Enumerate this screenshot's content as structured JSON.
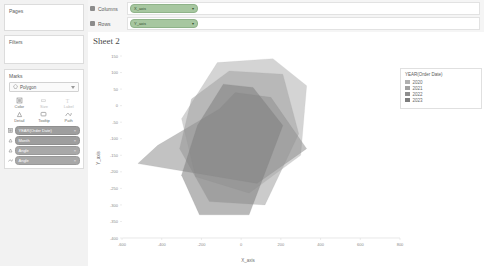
{
  "left_panel": {
    "pages": {
      "title": "Pages"
    },
    "filters": {
      "title": "Filters"
    },
    "marks": {
      "title": "Marks",
      "mark_type": "Polygon",
      "mark_type_icon": "polygon-icon",
      "properties": [
        {
          "label": "Color",
          "icon": "color-icon",
          "enabled": true
        },
        {
          "label": "Size",
          "icon": "size-icon",
          "enabled": false
        },
        {
          "label": "Label",
          "icon": "label-icon",
          "enabled": false
        },
        {
          "label": "Detail",
          "icon": "detail-icon",
          "enabled": true
        },
        {
          "label": "Tooltip",
          "icon": "tooltip-icon",
          "enabled": true
        },
        {
          "label": "Path",
          "icon": "path-icon",
          "enabled": true
        }
      ],
      "pills": [
        {
          "icon": "color-legend-icon",
          "label": "YEAR(Order Date)",
          "shade": "dark"
        },
        {
          "icon": "detail-icon",
          "label": "Month",
          "shade": "dark"
        },
        {
          "icon": "detail-icon",
          "label": "Angle",
          "shade": "light"
        },
        {
          "icon": "path-icon",
          "label": "Angle",
          "shade": "light"
        }
      ]
    }
  },
  "shelves": {
    "columns": {
      "name": "Columns",
      "pill": "X_axis",
      "icon": "columns-icon"
    },
    "rows": {
      "name": "Rows",
      "pill": "Y_axis",
      "icon": "rows-icon"
    }
  },
  "sheet": {
    "title": "Sheet 2"
  },
  "legend": {
    "title": "YEAR(Order Date)",
    "items": [
      {
        "label": "2020",
        "color": "#b0b0b0"
      },
      {
        "label": "2021",
        "color": "#a0a0a0"
      },
      {
        "label": "2022",
        "color": "#8f8f8f"
      },
      {
        "label": "2023",
        "color": "#7d7d7d"
      }
    ]
  },
  "chart_data": {
    "type": "area",
    "title": "Sheet 2",
    "xlabel": "X_axis",
    "ylabel": "Y_axis",
    "grid": false,
    "legend_position": "right",
    "xlim": [
      -600,
      800
    ],
    "ylim": [
      -400,
      150
    ],
    "xticks": [
      -600,
      -400,
      -200,
      0,
      200,
      400,
      600,
      800
    ],
    "yticks": [
      150,
      100,
      50,
      0,
      -50,
      -100,
      -150,
      -200,
      -250,
      -300,
      -350,
      -400
    ],
    "xticklabels": [
      "-600",
      "-400",
      "-200",
      "0",
      "200",
      "400",
      "600",
      "800"
    ],
    "yticklabels": [
      "150",
      "100",
      "50",
      "0",
      "-50",
      "-100",
      "-150",
      "-200",
      "-250",
      "-300",
      "-350",
      "-400"
    ],
    "series": [
      {
        "name": "2020",
        "color": "#b0b0b0",
        "opacity": 0.55,
        "points": [
          [
            -120,
            130
          ],
          [
            160,
            142
          ],
          [
            330,
            60
          ],
          [
            300,
            -150
          ],
          [
            40,
            -265
          ],
          [
            -230,
            -215
          ],
          [
            -300,
            -40
          ]
        ]
      },
      {
        "name": "2021",
        "color": "#a0a0a0",
        "opacity": 0.55,
        "points": [
          [
            -60,
            105
          ],
          [
            210,
            95
          ],
          [
            290,
            -85
          ],
          [
            120,
            -300
          ],
          [
            -160,
            -290
          ],
          [
            -310,
            -130
          ],
          [
            -250,
            20
          ]
        ]
      },
      {
        "name": "2022",
        "color": "#8f8f8f",
        "opacity": 0.55,
        "points": [
          [
            -30,
            40
          ],
          [
            150,
            25
          ],
          [
            330,
            -130
          ],
          [
            80,
            -235
          ],
          [
            -520,
            -175
          ],
          [
            -420,
            -120
          ],
          [
            -110,
            -10
          ]
        ]
      },
      {
        "name": "2023",
        "color": "#7d7d7d",
        "opacity": 0.55,
        "points": [
          [
            -90,
            65
          ],
          [
            60,
            55
          ],
          [
            210,
            -60
          ],
          [
            40,
            -330
          ],
          [
            -210,
            -330
          ],
          [
            -300,
            -210
          ],
          [
            -220,
            -60
          ]
        ]
      }
    ]
  }
}
